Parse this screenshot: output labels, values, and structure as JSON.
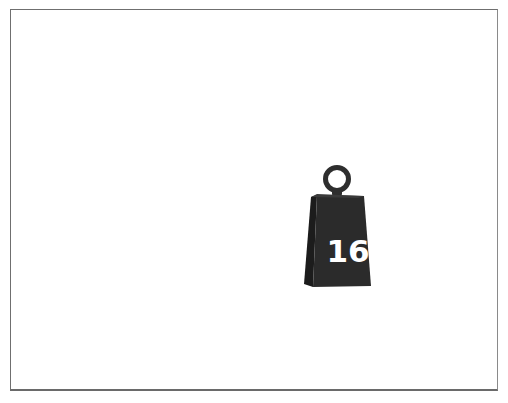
{
  "canvas": {
    "background": "#ffffff",
    "frame_border_color": "#6f6f6f"
  },
  "weight": {
    "icon": "kettlebell-weight-icon",
    "label": "16",
    "body_color": "#2b2b2b",
    "body_side_color": "#1c1c1c",
    "ring_color": "#2e2e2e",
    "label_color": "#ffffff"
  }
}
